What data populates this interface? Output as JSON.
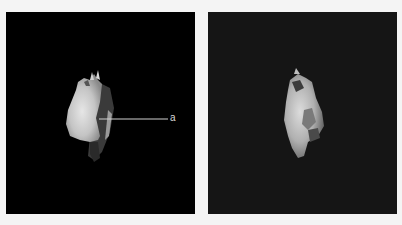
{
  "figure": {
    "panels": [
      {
        "id": "left",
        "description": "3D rendering of bone fragment on black background, with annotation",
        "background": "#000000",
        "annotations": [
          {
            "label": "a",
            "pointer": "horizontal leader line from object to label"
          }
        ]
      },
      {
        "id": "right",
        "description": "3D rendering of bone fragment, alternate view, on dark gray background",
        "background": "#151515",
        "annotations": []
      }
    ]
  }
}
